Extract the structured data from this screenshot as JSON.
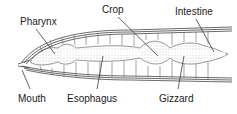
{
  "diagram": {
    "labels": {
      "pharynx": "Pharynx",
      "crop": "Crop",
      "intestine": "Intestine",
      "mouth": "Mouth",
      "esophagus": "Esophagus",
      "gizzard": "Gizzard"
    }
  }
}
